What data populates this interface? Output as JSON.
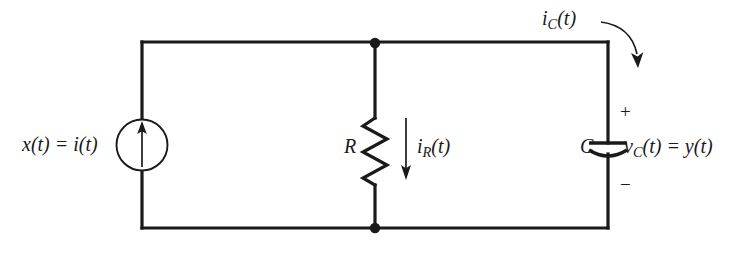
{
  "figure": {
    "name": "parallel-rc-circuit-with-current-source",
    "background_color": "#ffffff",
    "line_color": "#1a1a1a",
    "width": 749,
    "height": 260
  },
  "labels": {
    "source": {
      "text": "x(t) = i(t)",
      "lhs": "x(t) = i(t)"
    },
    "resistor": {
      "text": "R"
    },
    "resistor_current": {
      "base": "i",
      "sub": "R",
      "suffix": "(t)"
    },
    "capacitor": {
      "text": "C"
    },
    "capacitor_voltage": {
      "base": "v",
      "sub": "C",
      "suffix": "(t) = y(t)"
    },
    "capacitor_current": {
      "base": "i",
      "sub": "C",
      "suffix": "(t)"
    },
    "polarity_plus": {
      "text": "+"
    },
    "polarity_minus": {
      "text": "−"
    }
  },
  "components": [
    {
      "name": "current-source",
      "type": "independent-current-source",
      "symbol": "circle-with-up-arrow",
      "label": "x(t) = i(t)"
    },
    {
      "name": "resistor",
      "type": "resistor",
      "symbol": "zigzag",
      "label": "R",
      "current": "i_R(t)"
    },
    {
      "name": "capacitor",
      "type": "capacitor",
      "symbol": "curved-plate",
      "label": "C",
      "voltage": "v_C(t) = y(t)",
      "current": "i_C(t)"
    }
  ],
  "nodes": [
    {
      "name": "top-node",
      "x": 375,
      "y": 43
    },
    {
      "name": "bottom-node",
      "x": 375,
      "y": 228
    }
  ]
}
